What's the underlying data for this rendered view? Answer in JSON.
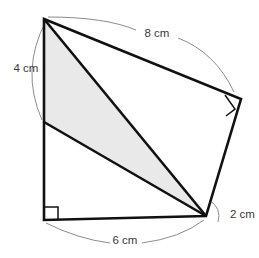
{
  "figure": {
    "type": "geometry-diagram",
    "background_color": "#ffffff",
    "outline_color": "#111111",
    "shade_color": "#e9e9e9",
    "arc_color": "#8c8c8c",
    "label_color": "#3a3a3a"
  },
  "labels": {
    "top": "8 cm",
    "left": "4 cm",
    "right": "2 cm",
    "bottom": "6 cm"
  },
  "label_positions": {
    "top": {
      "x": 157,
      "y": 34
    },
    "left": {
      "x": 26,
      "y": 69
    },
    "right": {
      "x": 230,
      "y": 215
    },
    "bottom": {
      "x": 125,
      "y": 241
    }
  },
  "vertices": {
    "apex_top_left": {
      "x": 44,
      "y": 19
    },
    "left_mid": {
      "x": 44,
      "y": 122
    },
    "bottom_left": {
      "x": 44,
      "y": 220
    },
    "bottom_right": {
      "x": 206,
      "y": 216
    },
    "right_top": {
      "x": 241,
      "y": 99
    }
  },
  "paths": {
    "outer_outline": "M 44 19 L 241 99 L 206 216 L 44 220 Z",
    "shaded_region": "M 44 19 L 44 122 L 206 216 Z",
    "diagonal_apex_to_bottom_right": "M 44 19 L 206 216",
    "edge_left_mid_to_bottom_right": "M 44 122 L 206 216"
  },
  "dimension_arcs": {
    "top_left_segment": "M 48 17 Q 105 17 136 30",
    "top_right_segment": "M 178 38 Q 215 52 234 92",
    "left_arc": "M 46 21 Q 20 70 42 120",
    "bottom_left_segment": "M 46 223 Q 78 239 110 243",
    "bottom_right_segment": "M 142 243 Q 180 238 204 220",
    "right_arc": "M 209 200 Q 222 208 218 222"
  },
  "right_angle_marks": {
    "bottom_left": "M 44 207 L 58 207 L 58 220",
    "right_top": "M 225 95 L 235 109 L 226 116"
  },
  "measurements": {
    "top_side_cm": 8,
    "left_segment_cm": 4,
    "right_segment_cm": 2,
    "bottom_side_cm": 6
  }
}
